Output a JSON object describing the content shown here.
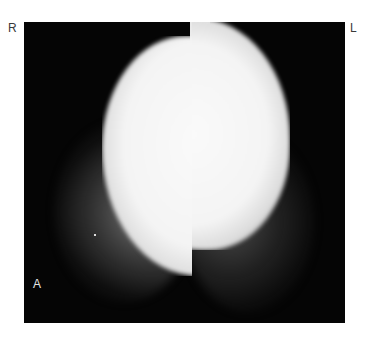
{
  "image": {
    "type": "radiograph",
    "description": "Grayscale X-ray with large dense bright oval mass and surrounding fibroglandular tissue",
    "labels": {
      "right": "R",
      "left": "L",
      "view": "A"
    },
    "colors": {
      "background": "#ffffff",
      "frame": "#050505",
      "dense_region": "#f4f4f4",
      "label_outer": "#3a3a3a",
      "label_inner": "#e6e6e6"
    }
  }
}
